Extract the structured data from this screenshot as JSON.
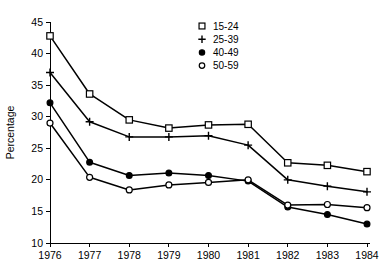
{
  "chart_data": {
    "type": "line",
    "title": "",
    "xlabel": "",
    "ylabel": "Percentage",
    "x": [
      1976,
      1977,
      1978,
      1979,
      1980,
      1981,
      1982,
      1983,
      1984
    ],
    "categories": [
      "1976",
      "1977",
      "1978",
      "1979",
      "1980",
      "1981",
      "1982",
      "1983",
      "1984"
    ],
    "xlim": [
      1976,
      1984
    ],
    "ylim": [
      10,
      45
    ],
    "yticks": [
      10,
      15,
      20,
      25,
      30,
      35,
      40,
      45
    ],
    "ytick_labels": [
      "10",
      "15",
      "20",
      "25",
      "30",
      "35",
      "40",
      "45"
    ],
    "xtick_labels": [
      "1976",
      "1977",
      "1978",
      "1979",
      "1980",
      "1981",
      "1982",
      "1983",
      "1984"
    ],
    "grid": false,
    "legend_position": "upper-center-right",
    "series": [
      {
        "name": "15-24",
        "marker": "open-square",
        "values": [
          42.8,
          33.6,
          29.5,
          28.2,
          28.7,
          28.8,
          22.7,
          22.3,
          21.3
        ]
      },
      {
        "name": "25-39",
        "marker": "plus",
        "values": [
          37.0,
          29.2,
          26.8,
          26.8,
          27.0,
          25.5,
          20.0,
          19.0,
          18.1
        ]
      },
      {
        "name": "40-49",
        "marker": "filled-circle",
        "values": [
          32.2,
          22.8,
          20.7,
          21.1,
          20.7,
          19.8,
          15.7,
          14.5,
          13.0
        ]
      },
      {
        "name": "50-59",
        "marker": "open-circle",
        "values": [
          29.0,
          20.4,
          18.4,
          19.2,
          19.6,
          20.0,
          16.0,
          16.1,
          15.6
        ]
      }
    ],
    "legend_entries": [
      {
        "label": "15-24",
        "marker": "open-square"
      },
      {
        "label": "25-39",
        "marker": "plus"
      },
      {
        "label": "40-49",
        "marker": "filled-circle"
      },
      {
        "label": "50-59",
        "marker": "open-circle"
      }
    ],
    "colors": {
      "line": "#000000",
      "marker_fill_open": "#ffffff",
      "marker_fill_solid": "#000000",
      "background": "#ffffff"
    }
  }
}
